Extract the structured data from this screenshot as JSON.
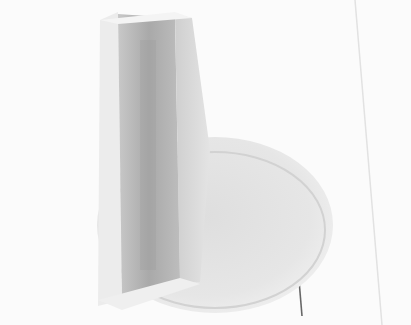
{
  "image": {
    "subject": "white plastic control knob on a round base, grayscale photograph",
    "colors": {
      "background": "#fbfbfb",
      "disc": "#e6e6e6",
      "disc_shadow": "#d4d4d4",
      "ridge_front": "#d9d9d9",
      "ridge_inner": "#bdbdbd",
      "ridge_dark": "#a8a8a8",
      "ridge_highlight": "#f2f2f2",
      "line": "#555555"
    }
  }
}
